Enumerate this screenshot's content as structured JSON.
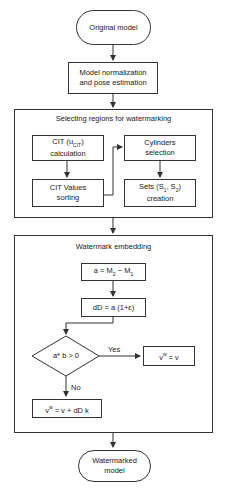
{
  "nodes": {
    "original_model": "Original model",
    "normalization_l1": "Model normalization",
    "normalization_l2": "and pose estimation",
    "selecting_group_title": "Selecting regions for watermarking",
    "cit_calc_l1": "CIT (u",
    "cit_calc_sub": "CIT",
    "cit_calc_l1_end": ")",
    "cit_calc_l2": "calculation",
    "cit_sort_l1": "CIT Values",
    "cit_sort_l2": "sorting",
    "cyl_sel_l1": "Cylinders",
    "cyl_sel_l2": "selection",
    "sets_l1": "Sets (S",
    "sets_sub1": "1",
    "sets_mid": ", S",
    "sets_sub2": "2",
    "sets_end": ")",
    "sets_l2": "creation",
    "embedding_group_title": "Watermark embedding",
    "a_eq_1": "a = M",
    "a_eq_sub1": "2",
    "a_eq_2": " − M",
    "a_eq_sub2": "1",
    "dD_eq": "dD = a (1+ε)",
    "decision": "a* b > 0",
    "yes_label": "Yes",
    "no_label": "No",
    "vw_eq_v_1": "v",
    "vw_eq_v_sup": "w",
    "vw_eq_v_2": " = v",
    "vw_eq_full_1": "v",
    "vw_eq_full_sup": "w",
    "vw_eq_full_2": " = v + dD k",
    "watermarked_l1": "Watermarked",
    "watermarked_l2": "model"
  },
  "colors": {
    "stroke": "#333333",
    "background": "#ffffff",
    "text": "#222222"
  }
}
